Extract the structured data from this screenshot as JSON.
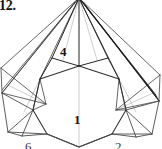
{
  "figure": {
    "caption": "12.",
    "width": 162,
    "height": 149,
    "background_color": "#ffffff",
    "line_color": "#3b3b3b",
    "thin_line_color": "#9a9a9a",
    "dark_line_color": "#1b1b1b"
  },
  "labels": [
    {
      "id": "label-4",
      "text": "4",
      "x": 60,
      "y": 45,
      "clipped": false
    },
    {
      "id": "label-1",
      "text": "1",
      "x": 74,
      "y": 113,
      "clipped": false
    },
    {
      "id": "label-6",
      "text": "6",
      "x": 25,
      "y": 140,
      "clipped": true
    },
    {
      "id": "label-2",
      "text": "2",
      "x": 115,
      "y": 140,
      "clipped": true
    }
  ],
  "geometry": {
    "apex": {
      "x": 79,
      "y": -2
    },
    "center_polygon": [
      {
        "x": 79,
        "y": 66
      },
      {
        "x": 119,
        "y": 79
      },
      {
        "x": 126,
        "y": 110
      },
      {
        "x": 112,
        "y": 134
      },
      {
        "x": 79,
        "y": 147
      },
      {
        "x": 47,
        "y": 134
      },
      {
        "x": 33,
        "y": 110
      },
      {
        "x": 40,
        "y": 79
      }
    ],
    "center_vertical_crease": {
      "x1": 79,
      "y1": 66,
      "x2": 79,
      "y2": 147
    },
    "left_wing": [
      {
        "x": 79,
        "y": -2
      },
      {
        "x": 40,
        "y": 79
      },
      {
        "x": 2,
        "y": 93
      },
      {
        "x": 1,
        "y": 68
      }
    ],
    "right_wing": [
      {
        "x": 79,
        "y": -2
      },
      {
        "x": 119,
        "y": 79
      },
      {
        "x": 159,
        "y": 101
      },
      {
        "x": 160,
        "y": 75
      }
    ]
  }
}
